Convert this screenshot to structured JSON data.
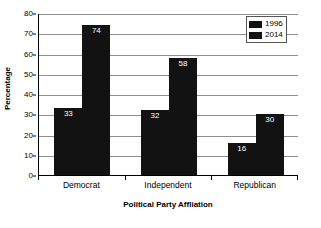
{
  "chart_data": {
    "type": "bar",
    "title": "",
    "xlabel": "Political Party Affliation",
    "ylabel": "Percentage",
    "categories": [
      "Democrat",
      "Independent",
      "Republican"
    ],
    "series": [
      {
        "name": "1996",
        "values": [
          33,
          32,
          16
        ],
        "color": "#121212"
      },
      {
        "name": "2014",
        "values": [
          74,
          58,
          30
        ],
        "color": "#121212"
      }
    ],
    "ylim": [
      0,
      80
    ],
    "yticks": [
      0,
      10,
      20,
      30,
      40,
      50,
      60,
      70,
      80
    ],
    "ytick_labels": [
      "0",
      "10",
      "20",
      "30",
      "40",
      "50",
      "60",
      "70",
      "80"
    ],
    "grid": "horizontal",
    "legend_position": "top-right",
    "data_labels": true,
    "data_label_color": "#ffffff",
    "gridline_color": "#8e8e8e",
    "axis_color": "#000000",
    "background": "#ffffff"
  },
  "legend": {
    "entries": [
      {
        "label": "1996"
      },
      {
        "label": "2014"
      }
    ]
  },
  "axes": {
    "y_title": "Percentage",
    "x_title": "Political Party Affliation"
  }
}
